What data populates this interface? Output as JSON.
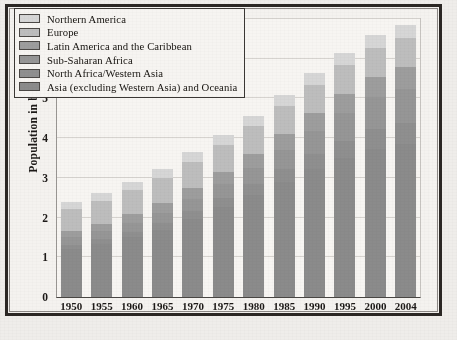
{
  "chart_data": {
    "type": "bar",
    "stacked": true,
    "title": "",
    "subtitle": "",
    "xlabel": "",
    "ylabel": "Population in billions",
    "ylim": [
      0,
      7
    ],
    "ytick_labels": [
      "0",
      "1",
      "2",
      "3",
      "4",
      "5",
      "6",
      "7"
    ],
    "ytick_values": [
      0,
      1,
      2,
      3,
      4,
      5,
      6,
      7
    ],
    "grid": true,
    "legend_position": "top-left",
    "categories": [
      "1950",
      "1955",
      "1960",
      "1965",
      "1970",
      "1975",
      "1980",
      "1985",
      "1990",
      "1995",
      "2000",
      "2004"
    ],
    "series": [
      {
        "name": "Asia (excluding Western Asia) and Oceania",
        "color": "#8b8b8b",
        "values": [
          1.21,
          1.34,
          1.5,
          1.7,
          1.97,
          2.26,
          2.57,
          2.9,
          3.22,
          3.5,
          3.73,
          3.86
        ]
      },
      {
        "name": "North Africa/Western Asia",
        "color": "#8f8f8f",
        "values": [
          0.11,
          0.12,
          0.14,
          0.16,
          0.19,
          0.23,
          0.27,
          0.32,
          0.38,
          0.44,
          0.5,
          0.53
        ]
      },
      {
        "name": "Sub-Saharan Africa",
        "color": "#969696",
        "values": [
          0.18,
          0.2,
          0.23,
          0.26,
          0.3,
          0.35,
          0.41,
          0.49,
          0.59,
          0.69,
          0.8,
          0.86
        ]
      },
      {
        "name": "Latin America and the Caribbean",
        "color": "#9d9d9d",
        "values": [
          0.17,
          0.19,
          0.22,
          0.25,
          0.29,
          0.32,
          0.36,
          0.4,
          0.44,
          0.48,
          0.52,
          0.55
        ]
      },
      {
        "name": "Europe",
        "color": "#bdbdbd",
        "values": [
          0.55,
          0.58,
          0.6,
          0.63,
          0.66,
          0.68,
          0.69,
          0.71,
          0.72,
          0.73,
          0.73,
          0.73
        ]
      },
      {
        "name": "Northern America",
        "color": "#d6d6d6",
        "values": [
          0.17,
          0.19,
          0.2,
          0.22,
          0.23,
          0.24,
          0.25,
          0.27,
          0.28,
          0.3,
          0.31,
          0.33
        ]
      }
    ],
    "totals": [
      2.49,
      2.72,
      2.99,
      3.24,
      3.64,
      4.08,
      4.55,
      5.09,
      5.63,
      6.14,
      6.59,
      6.86
    ],
    "annotations": []
  },
  "legend": {
    "items": [
      {
        "label": "Northern America",
        "color": "#d6d6d6"
      },
      {
        "label": "Europe",
        "color": "#bdbdbd"
      },
      {
        "label": "Latin America and the Caribbean",
        "color": "#9d9d9d"
      },
      {
        "label": "Sub-Saharan Africa",
        "color": "#969696"
      },
      {
        "label": "North Africa/Western Asia",
        "color": "#8f8f8f"
      },
      {
        "label": "Asia (excluding Western Asia) and Oceania",
        "color": "#8b8b8b"
      }
    ]
  },
  "colors": {
    "page_background": "#efedea",
    "plot_background": "#f7f5f2",
    "frame": "#2b2724",
    "gridline": "#d6d3cf",
    "text": "#16130f"
  }
}
